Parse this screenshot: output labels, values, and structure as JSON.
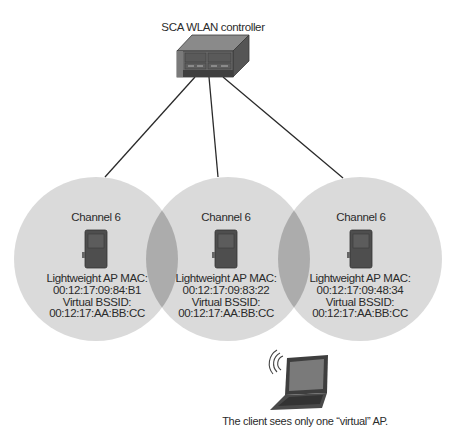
{
  "controller": {
    "label": "SCA WLAN controller",
    "icon": "wlan-controller-icon"
  },
  "cells": [
    {
      "channel": "Channel 6",
      "mac_label": "Lightweight AP MAC:",
      "mac": "00:12:17:09:84:B1",
      "bssid_label": "Virtual BSSID:",
      "bssid": "00:12:17:AA:BB:CC",
      "icon": "access-point-icon"
    },
    {
      "channel": "Channel 6",
      "mac_label": "Lightweight AP MAC:",
      "mac": "00:12:17:09:83:22",
      "bssid_label": "Virtual BSSID:",
      "bssid": "00:12:17:AA:BB:CC",
      "icon": "access-point-icon"
    },
    {
      "channel": "Channel 6",
      "mac_label": "Lightweight AP MAC:",
      "mac": "00:12:17:09:48:34",
      "bssid_label": "Virtual BSSID:",
      "bssid": "00:12:17:AA:BB:CC",
      "icon": "access-point-icon"
    }
  ],
  "client": {
    "icon": "wireless-laptop-icon",
    "caption": "The client sees only one “virtual” AP."
  },
  "colors": {
    "cell_fill": "#dadada",
    "overlap_fill": "#acacac",
    "link_line": "#2a2a2a",
    "device_dark": "#4a4a4a"
  }
}
